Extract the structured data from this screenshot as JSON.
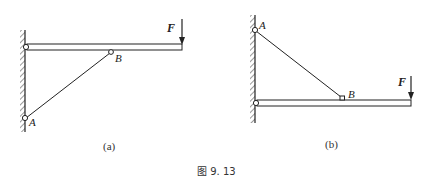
{
  "figure": {
    "caption": "图 9. 13",
    "panels": [
      {
        "id": "a",
        "label": "(a)",
        "force_label": "F",
        "point_labels": {
          "A": "A",
          "B": "B"
        }
      },
      {
        "id": "b",
        "label": "(b)",
        "force_label": "F",
        "point_labels": {
          "A": "A",
          "B": "B"
        }
      }
    ]
  }
}
